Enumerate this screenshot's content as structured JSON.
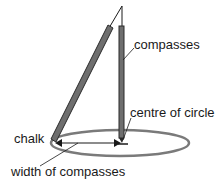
{
  "diagram": {
    "labels": {
      "compasses": "compasses",
      "centre": "centre of circle",
      "chalk": "chalk",
      "width": "width of compasses"
    },
    "colors": {
      "leg_fill": "#6e6e6e",
      "leg_stroke": "#2a2a2a",
      "ellipse": "#7a7a7a",
      "line": "#1a1a1a"
    }
  }
}
